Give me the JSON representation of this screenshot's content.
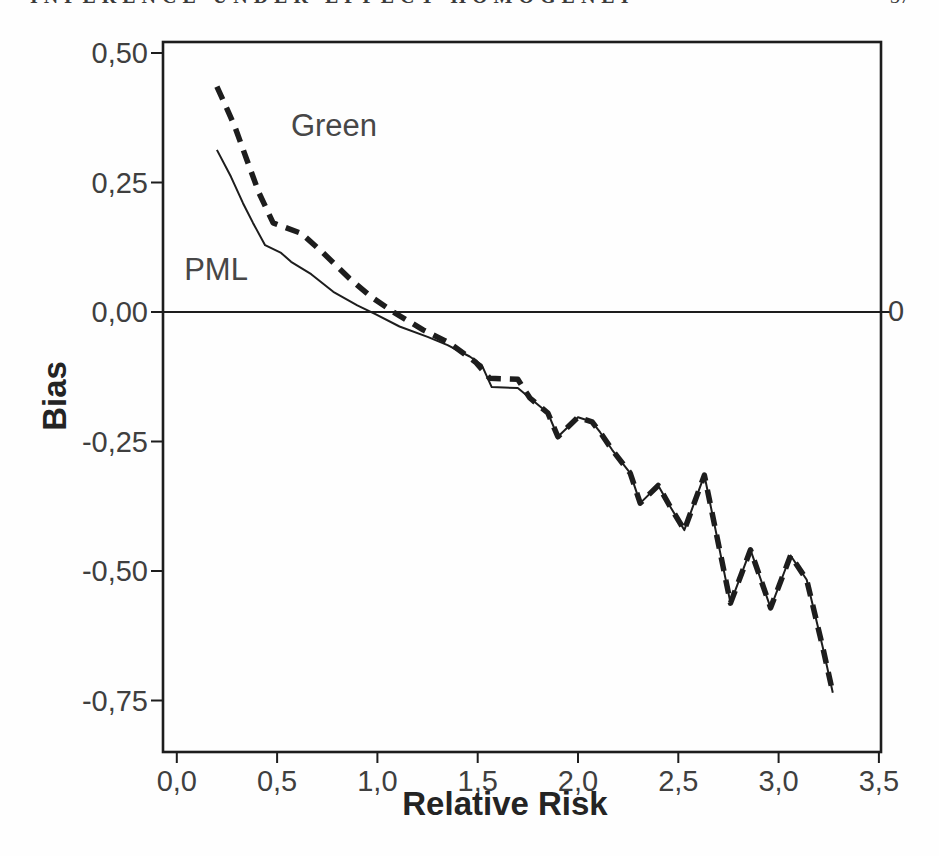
{
  "page": {
    "running_header_text": "INFERENCE UNDER EFFECT HOMOGENEITY",
    "page_number": "37"
  },
  "chart_data": {
    "type": "line",
    "title": "",
    "xlabel": "Relative Risk",
    "ylabel": "Bias",
    "xlim": [
      -0.07,
      3.51
    ],
    "ylim": [
      -0.85,
      0.52
    ],
    "grid": false,
    "legend": "inline-labels",
    "decimal_style": "comma",
    "ink_color": "#1d1d1d",
    "x_ticks": [
      {
        "v": 0.0,
        "label": "0,0"
      },
      {
        "v": 0.5,
        "label": "0,5"
      },
      {
        "v": 1.0,
        "label": "1,0"
      },
      {
        "v": 1.5,
        "label": "1,5"
      },
      {
        "v": 2.0,
        "label": "2,0"
      },
      {
        "v": 2.5,
        "label": "2,5"
      },
      {
        "v": 3.0,
        "label": "3,0"
      },
      {
        "v": 3.5,
        "label": "3,5"
      }
    ],
    "y_ticks": [
      {
        "v": 0.5,
        "label": "0,50"
      },
      {
        "v": 0.25,
        "label": "0,25"
      },
      {
        "v": 0.0,
        "label": "0,00"
      },
      {
        "v": -0.25,
        "label": "-0,25"
      },
      {
        "v": -0.5,
        "label": "-0,50"
      },
      {
        "v": -0.75,
        "label": "-0,75"
      }
    ],
    "reference_line": {
      "y": 0,
      "right_tick_label": "0"
    },
    "series": [
      {
        "name": "Green",
        "style": "dashed",
        "stroke_width": 5.5,
        "points": [
          [
            0.2,
            0.435
          ],
          [
            0.25,
            0.392
          ],
          [
            0.29,
            0.357
          ],
          [
            0.35,
            0.293
          ],
          [
            0.41,
            0.23
          ],
          [
            0.48,
            0.172
          ],
          [
            0.55,
            0.162
          ],
          [
            0.62,
            0.152
          ],
          [
            0.73,
            0.114
          ],
          [
            0.86,
            0.065
          ],
          [
            0.97,
            0.029
          ],
          [
            1.08,
            0.0
          ],
          [
            1.23,
            -0.035
          ],
          [
            1.36,
            -0.06
          ],
          [
            1.49,
            -0.097
          ],
          [
            1.56,
            -0.128
          ],
          [
            1.7,
            -0.13
          ],
          [
            1.76,
            -0.166
          ],
          [
            1.85,
            -0.195
          ],
          [
            1.9,
            -0.241
          ],
          [
            2.0,
            -0.203
          ],
          [
            2.07,
            -0.212
          ],
          [
            2.11,
            -0.232
          ],
          [
            2.17,
            -0.266
          ],
          [
            2.26,
            -0.311
          ],
          [
            2.31,
            -0.369
          ],
          [
            2.4,
            -0.335
          ],
          [
            2.46,
            -0.376
          ],
          [
            2.53,
            -0.421
          ],
          [
            2.63,
            -0.315
          ],
          [
            2.76,
            -0.562
          ],
          [
            2.86,
            -0.459
          ],
          [
            2.96,
            -0.571
          ],
          [
            3.06,
            -0.47
          ],
          [
            3.14,
            -0.517
          ],
          [
            3.22,
            -0.647
          ],
          [
            3.27,
            -0.735
          ]
        ]
      },
      {
        "name": "PML",
        "style": "solid",
        "stroke_width": 2,
        "points": [
          [
            0.2,
            0.313
          ],
          [
            0.27,
            0.261
          ],
          [
            0.33,
            0.21
          ],
          [
            0.38,
            0.172
          ],
          [
            0.44,
            0.129
          ],
          [
            0.52,
            0.114
          ],
          [
            0.57,
            0.097
          ],
          [
            0.67,
            0.073
          ],
          [
            0.78,
            0.039
          ],
          [
            0.9,
            0.013
          ],
          [
            0.99,
            -0.004
          ],
          [
            1.11,
            -0.028
          ],
          [
            1.25,
            -0.048
          ],
          [
            1.35,
            -0.064
          ],
          [
            1.46,
            -0.086
          ],
          [
            1.52,
            -0.102
          ],
          [
            1.57,
            -0.145
          ],
          [
            1.7,
            -0.147
          ],
          [
            1.76,
            -0.166
          ],
          [
            1.85,
            -0.195
          ],
          [
            1.9,
            -0.241
          ],
          [
            2.0,
            -0.203
          ],
          [
            2.07,
            -0.212
          ],
          [
            2.11,
            -0.232
          ],
          [
            2.17,
            -0.266
          ],
          [
            2.26,
            -0.311
          ],
          [
            2.31,
            -0.369
          ],
          [
            2.4,
            -0.335
          ],
          [
            2.46,
            -0.376
          ],
          [
            2.53,
            -0.421
          ],
          [
            2.63,
            -0.315
          ],
          [
            2.76,
            -0.562
          ],
          [
            2.86,
            -0.459
          ],
          [
            2.96,
            -0.571
          ],
          [
            3.06,
            -0.47
          ],
          [
            3.14,
            -0.517
          ],
          [
            3.22,
            -0.647
          ],
          [
            3.27,
            -0.735
          ]
        ]
      }
    ]
  }
}
